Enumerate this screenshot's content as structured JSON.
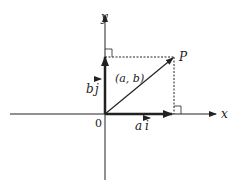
{
  "diagram": {
    "axes": {
      "x_label": "x",
      "y_label": "y",
      "origin_label": "0"
    },
    "point": {
      "label": "P",
      "coords_label": "(a, b)"
    },
    "vectors": [
      {
        "name": "a i",
        "coef": "a",
        "unit": "i",
        "direction": "horizontal"
      },
      {
        "name": "b j",
        "coef": "b",
        "unit": "j",
        "direction": "vertical"
      },
      {
        "name": "OP",
        "from": "origin",
        "to": "P"
      }
    ],
    "colors": {
      "line": "#222222",
      "background": "#ffffff"
    }
  }
}
